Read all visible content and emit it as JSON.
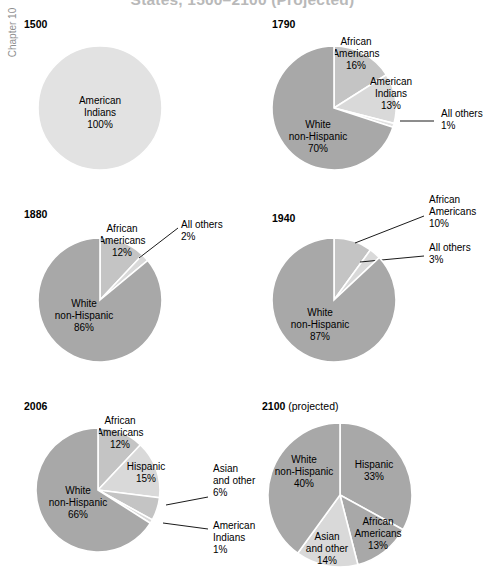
{
  "header": {
    "title": "States, 1500–2100 (Projected)",
    "chapter_tab": "Chapter 10"
  },
  "colors": {
    "dark_gray": "#a8a8a8",
    "mid_gray": "#c4c4c4",
    "light_gray": "#d9d9d9",
    "very_light_gray": "#e2e2e2",
    "separator": "#ffffff",
    "text": "#000000",
    "title_gray": "#b9b9b9"
  },
  "chart_data": {
    "type": "pie",
    "title": "States, 1500–2100 (Projected)",
    "charts": [
      {
        "id": "pie-1500",
        "year": "1500",
        "note": "",
        "slices": [
          {
            "label_lines": [
              "American",
              "Indians"
            ],
            "value": 100,
            "value_label": "100%",
            "color": "very_light_gray",
            "placement": "inside"
          }
        ]
      },
      {
        "id": "pie-1790",
        "year": "1790",
        "note": "",
        "slices": [
          {
            "label_lines": [
              "African",
              "Americans"
            ],
            "value": 16,
            "value_label": "16%",
            "color": "mid_gray",
            "placement": "inside"
          },
          {
            "label_lines": [
              "American",
              "Indians"
            ],
            "value": 13,
            "value_label": "13%",
            "color": "light_gray",
            "placement": "inside"
          },
          {
            "label_lines": [
              "All others"
            ],
            "value": 1,
            "value_label": "1%",
            "color": "very_light_gray",
            "placement": "outside"
          },
          {
            "label_lines": [
              "White",
              "non-Hispanic"
            ],
            "value": 70,
            "value_label": "70%",
            "color": "dark_gray",
            "placement": "inside"
          }
        ]
      },
      {
        "id": "pie-1880",
        "year": "1880",
        "note": "",
        "slices": [
          {
            "label_lines": [
              "African",
              "Americans"
            ],
            "value": 12,
            "value_label": "12%",
            "color": "mid_gray",
            "placement": "inside"
          },
          {
            "label_lines": [
              "All others"
            ],
            "value": 2,
            "value_label": "2%",
            "color": "light_gray",
            "placement": "outside"
          },
          {
            "label_lines": [
              "White",
              "non-Hispanic"
            ],
            "value": 86,
            "value_label": "86%",
            "color": "dark_gray",
            "placement": "inside"
          }
        ]
      },
      {
        "id": "pie-1940",
        "year": "1940",
        "note": "",
        "slices": [
          {
            "label_lines": [
              "African",
              "Americans"
            ],
            "value": 10,
            "value_label": "10%",
            "color": "mid_gray",
            "placement": "outside"
          },
          {
            "label_lines": [
              "All others"
            ],
            "value": 3,
            "value_label": "3%",
            "color": "light_gray",
            "placement": "outside"
          },
          {
            "label_lines": [
              "White",
              "non-Hispanic"
            ],
            "value": 87,
            "value_label": "87%",
            "color": "dark_gray",
            "placement": "inside"
          }
        ]
      },
      {
        "id": "pie-2006",
        "year": "2006",
        "note": "",
        "slices": [
          {
            "label_lines": [
              "African",
              "Americans"
            ],
            "value": 12,
            "value_label": "12%",
            "color": "mid_gray",
            "placement": "inside"
          },
          {
            "label_lines": [
              "Hispanic"
            ],
            "value": 15,
            "value_label": "15%",
            "color": "light_gray",
            "placement": "inside"
          },
          {
            "label_lines": [
              "Asian",
              "and other"
            ],
            "value": 6,
            "value_label": "6%",
            "color": "mid_gray",
            "placement": "outside"
          },
          {
            "label_lines": [
              "American",
              "Indians"
            ],
            "value": 1,
            "value_label": "1%",
            "color": "light_gray",
            "placement": "outside"
          },
          {
            "label_lines": [
              "White",
              "non-Hispanic"
            ],
            "value": 66,
            "value_label": "66%",
            "color": "dark_gray",
            "placement": "inside"
          }
        ]
      },
      {
        "id": "pie-2100",
        "year": "2100",
        "note": "(projected)",
        "slices": [
          {
            "label_lines": [
              "Hispanic"
            ],
            "value": 33,
            "value_label": "33%",
            "color": "dark_gray",
            "placement": "inside"
          },
          {
            "label_lines": [
              "African",
              "Americans"
            ],
            "value": 13,
            "value_label": "13%",
            "color": "dark_gray",
            "placement": "inside"
          },
          {
            "label_lines": [
              "Asian",
              "and other"
            ],
            "value": 14,
            "value_label": "14%",
            "color": "light_gray",
            "placement": "inside"
          },
          {
            "label_lines": [
              "White",
              "non-Hispanic"
            ],
            "value": 40,
            "value_label": "40%",
            "color": "dark_gray",
            "placement": "inside"
          }
        ]
      }
    ]
  },
  "layout": {
    "panels": [
      {
        "id": "pie-1500",
        "year_x": 24,
        "year_y": 18,
        "cx": 100,
        "cy": 108,
        "r": 62,
        "start_angle": 0
      },
      {
        "id": "pie-1790",
        "year_x": 272,
        "year_y": 18,
        "cx": 334,
        "cy": 108,
        "r": 62,
        "start_angle": 0
      },
      {
        "id": "pie-1880",
        "year_x": 24,
        "year_y": 208,
        "cx": 100,
        "cy": 300,
        "r": 62,
        "start_angle": 0
      },
      {
        "id": "pie-1940",
        "year_x": 272,
        "year_y": 212,
        "cx": 334,
        "cy": 300,
        "r": 62,
        "start_angle": 0
      },
      {
        "id": "pie-2006",
        "year_x": 24,
        "year_y": 400,
        "cx": 98,
        "cy": 490,
        "r": 62,
        "start_angle": 0
      },
      {
        "id": "pie-2100",
        "year_x": 262,
        "year_y": 400,
        "cx": 340,
        "cy": 495,
        "r": 72,
        "start_angle": 0
      }
    ],
    "label_overrides": {
      "pie-1500": {
        "American Indians": {
          "x": 100,
          "y": 104
        }
      },
      "pie-1790": {
        "African Americans": {
          "x": 356,
          "y": 45
        },
        "American Indians": {
          "x": 391,
          "y": 85
        },
        "All others": {
          "x": 441,
          "y": 117,
          "anchor": "start",
          "leader": [
            [
              400,
              121
            ],
            [
              434,
              121
            ]
          ]
        },
        "White non-Hispanic": {
          "x": 318,
          "y": 128
        }
      },
      "pie-1880": {
        "African Americans": {
          "x": 122,
          "y": 232
        },
        "All others": {
          "x": 181,
          "y": 228,
          "anchor": "start",
          "leader": [
            [
              139,
              258
            ],
            [
              178,
              228
            ]
          ]
        },
        "White non-Hispanic": {
          "x": 84,
          "y": 307
        }
      },
      "pie-1940": {
        "African Americans": {
          "x": 429,
          "y": 203,
          "anchor": "start",
          "leader": [
            [
              355,
              243
            ],
            [
              424,
              216
            ]
          ]
        },
        "All others": {
          "x": 429,
          "y": 251,
          "anchor": "start",
          "leader": [
            [
              360,
              262
            ],
            [
              424,
              256
            ]
          ]
        },
        "White non-Hispanic": {
          "x": 320,
          "y": 316
        }
      },
      "pie-2006": {
        "African Americans": {
          "x": 120,
          "y": 424
        },
        "Hispanic": {
          "x": 146,
          "y": 470
        },
        "Asian and other": {
          "x": 213,
          "y": 472,
          "anchor": "start",
          "leader": [
            [
              166,
              505
            ],
            [
              208,
              497
            ]
          ]
        },
        "American Indians": {
          "x": 213,
          "y": 529,
          "anchor": "start",
          "leader": [
            [
              163,
              523
            ],
            [
              208,
              529
            ]
          ]
        },
        "White non-Hispanic": {
          "x": 78,
          "y": 494
        }
      },
      "pie-2100": {
        "Hispanic": {
          "x": 374,
          "y": 468
        },
        "African Americans": {
          "x": 378,
          "y": 525
        },
        "Asian and other": {
          "x": 327,
          "y": 540
        },
        "White non-Hispanic": {
          "x": 304,
          "y": 463
        }
      }
    }
  }
}
